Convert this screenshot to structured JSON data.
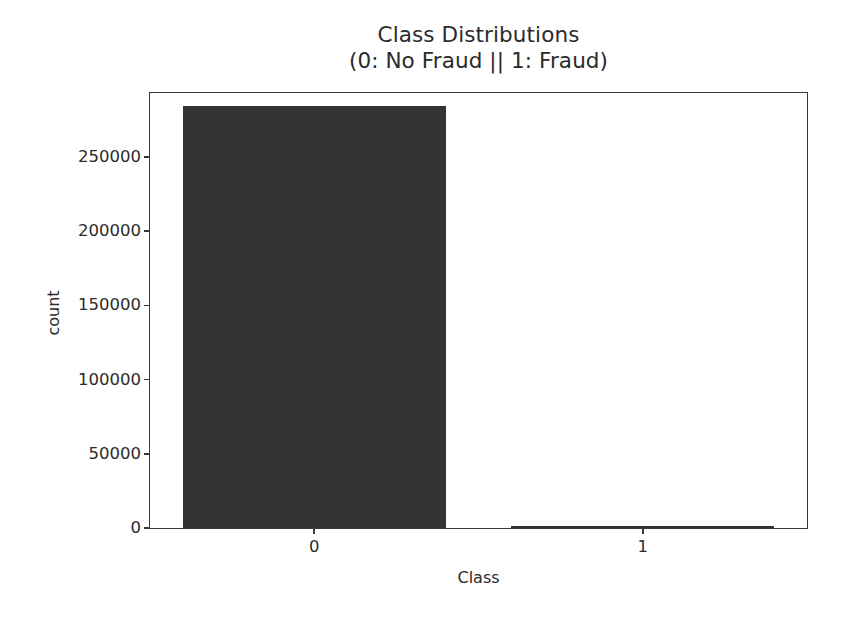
{
  "chart_data": {
    "type": "bar",
    "title": "Class Distributions",
    "subtitle": "(0: No Fraud || 1: Fraud)",
    "xlabel": "Class",
    "ylabel": "count",
    "categories": [
      "0",
      "1"
    ],
    "values": [
      284315,
      492
    ],
    "series": [
      {
        "name": "count",
        "values": [
          284315,
          492
        ]
      }
    ],
    "ylim": [
      0,
      293000
    ],
    "yticks": [
      0,
      50000,
      100000,
      150000,
      200000,
      250000
    ],
    "ytick_labels": [
      "0",
      "50000",
      "100000",
      "150000",
      "200000",
      "250000"
    ],
    "xtick_labels": [
      "0",
      "1"
    ],
    "grid": false,
    "legend": false,
    "bar_color": "#333333",
    "axes_color": "#3a3a3a",
    "text_color": "#2b2b2b",
    "background": "#ffffff"
  }
}
